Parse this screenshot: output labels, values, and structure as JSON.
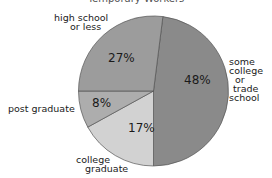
{
  "chart_data": {
    "type": "pie",
    "title": "Temporary Workers",
    "slices": [
      {
        "label": "some college or trade school",
        "value": 48,
        "color": "#8a8a8a"
      },
      {
        "label": "college graduate",
        "value": 17,
        "color": "#d2d2d2"
      },
      {
        "label": "post graduate",
        "value": 8,
        "color": "#adadad"
      },
      {
        "label": "high school or less",
        "value": 27,
        "color": "#9c9c9c"
      }
    ],
    "start_angle_deg": 7.2,
    "direction": "clockwise",
    "legend": "none (direct labels)"
  },
  "labels": {
    "title": "Temporary Workers",
    "high_school": [
      "high school",
      "or less"
    ],
    "some_college": [
      "some",
      "college",
      "or",
      "trade",
      "school"
    ],
    "post_graduate": "post graduate",
    "college_graduate": [
      "college",
      "graduate"
    ],
    "pct_high_school": "27%",
    "pct_some_college": "48%",
    "pct_post_graduate": "8%",
    "pct_college_graduate": "17%"
  }
}
